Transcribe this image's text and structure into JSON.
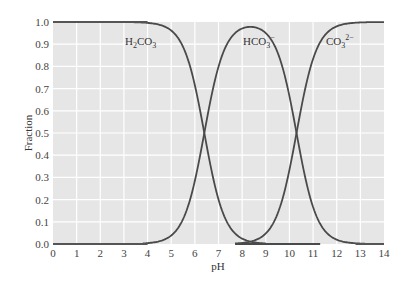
{
  "chart_data": {
    "type": "line",
    "title": "",
    "xlabel": "pH",
    "ylabel": "Fraction",
    "xlim": [
      0,
      14
    ],
    "ylim": [
      0,
      1.0
    ],
    "grid": true,
    "legend_position": "inline-labels",
    "x_ticks": [
      "0",
      "1",
      "2",
      "3",
      "4",
      "5",
      "6",
      "7",
      "8",
      "9",
      "10",
      "11",
      "12",
      "13",
      "14"
    ],
    "y_ticks": [
      "0.0",
      "0.1",
      "0.2",
      "0.3",
      "0.4",
      "0.5",
      "0.6",
      "0.7",
      "0.8",
      "0.9",
      "1.0"
    ],
    "pKa1": 6.4,
    "pKa2": 10.3,
    "series": [
      {
        "name": "H2CO3",
        "label_main": "H",
        "label_sub1": "2",
        "label_mid": "CO",
        "label_sub2": "3",
        "label_sup": "",
        "x": [
          0,
          4,
          5,
          6,
          6.4,
          7,
          8,
          8.5,
          9
        ],
        "values": [
          1.0,
          1.0,
          0.96,
          0.72,
          0.5,
          0.2,
          0.02,
          0.0,
          0.0
        ]
      },
      {
        "name": "HCO3-",
        "label_main": "HCO",
        "label_sub1": "",
        "label_mid": "",
        "label_sub2": "3",
        "label_sup": "−",
        "x": [
          4,
          5,
          6,
          6.4,
          7,
          8,
          8.4,
          9,
          10,
          10.3,
          11,
          12,
          13
        ],
        "values": [
          0.0,
          0.04,
          0.28,
          0.5,
          0.8,
          0.97,
          0.98,
          0.95,
          0.67,
          0.5,
          0.17,
          0.02,
          0.0
        ]
      },
      {
        "name": "CO3 2-",
        "label_main": "CO",
        "label_sub1": "",
        "label_mid": "",
        "label_sub2": "3",
        "label_sup": "2−",
        "x": [
          7.7,
          8.5,
          9,
          10,
          10.3,
          11,
          12,
          13,
          14
        ],
        "values": [
          0.0,
          0.0,
          0.04,
          0.33,
          0.5,
          0.83,
          0.98,
          1.0,
          1.0
        ]
      }
    ],
    "annotations": [
      "H2CO3",
      "HCO3-",
      "CO3 2-"
    ]
  },
  "labels": {
    "xlabel": "pH",
    "ylabel": "Fraction"
  },
  "style": {
    "plot_bg": "#e6e6e6",
    "grid_color": "#ffffff",
    "curve_color": "#4a4a4a",
    "axis_line_color": "#555555"
  }
}
